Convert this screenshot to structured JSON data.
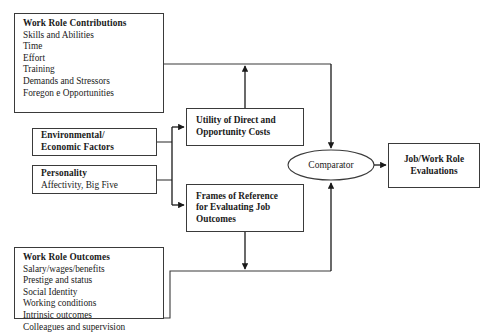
{
  "diagram": {
    "title_visible": false,
    "canvas": {
      "width": 492,
      "height": 333,
      "background": "#ffffff"
    },
    "stroke_color": "#3a3a3a",
    "text_color": "#1a1a1a"
  },
  "nodes": {
    "contributions": {
      "heading": "Work Role Contributions",
      "items": [
        "Skills and Abilities",
        "Time",
        "Effort",
        "Training",
        "Demands and Stressors",
        "Foregon e Opportunities"
      ]
    },
    "environmental": {
      "heading_line1": "Environmental/",
      "heading_line2": "Economic Factors"
    },
    "personality": {
      "heading": "Personality",
      "items": [
        "Affectivity, Big Five"
      ]
    },
    "outcomes": {
      "heading": "Work Role Outcomes",
      "items": [
        "Salary/wages/benefits",
        "Prestige and status",
        "Social Identity",
        "Working conditions",
        "Intrinsic outcomes",
        "Colleagues and supervision"
      ]
    },
    "utility": {
      "line1": "Utility of Direct and",
      "line2": "Opportunity Costs"
    },
    "frames": {
      "line1": "Frames of Reference",
      "line2": "for Evaluating Job",
      "line3": "Outcomes"
    },
    "comparator": {
      "label": "Comparator"
    },
    "evaluations": {
      "line1": "Job/Work Role",
      "line2": "Evaluations"
    }
  }
}
